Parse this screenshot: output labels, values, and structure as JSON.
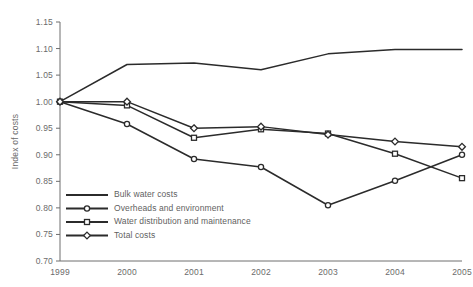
{
  "chart_data": {
    "type": "line",
    "title": "",
    "xlabel": "",
    "ylabel": "Index of costs",
    "categories": [
      "1999",
      "2000",
      "2001",
      "2002",
      "2003",
      "2004",
      "2005"
    ],
    "x": [
      1999,
      2000,
      2001,
      2002,
      2003,
      2004,
      2005
    ],
    "ylim": [
      0.7,
      1.15
    ],
    "yticks": [
      "0.70",
      "0.75",
      "0.80",
      "0.85",
      "0.90",
      "0.95",
      "1.00",
      "1.05",
      "1.10",
      "1.15"
    ],
    "ytick_values": [
      0.7,
      0.75,
      0.8,
      0.85,
      0.9,
      0.95,
      1.0,
      1.05,
      1.1,
      1.15
    ],
    "grid": false,
    "legend_position": "inside-lower-left",
    "series": [
      {
        "name": "Bulk water costs",
        "marker": "none",
        "values": [
          1.0,
          1.07,
          1.073,
          1.06,
          1.09,
          1.098,
          1.098
        ]
      },
      {
        "name": "Overheads and environment",
        "marker": "circle",
        "values": [
          1.0,
          0.958,
          0.892,
          0.877,
          0.805,
          0.851,
          0.9
        ]
      },
      {
        "name": "Water distribution and maintenance",
        "marker": "square",
        "values": [
          1.0,
          0.993,
          0.932,
          0.948,
          0.94,
          0.902,
          0.856
        ]
      },
      {
        "name": "Total costs",
        "marker": "diamond",
        "values": [
          1.0,
          1.0,
          0.95,
          0.953,
          0.938,
          0.925,
          0.915
        ]
      }
    ],
    "colors": {
      "line": "#2b2b2b",
      "marker_fill": "#ffffff",
      "axis": "#6e6e6e",
      "text": "#6b6b6b",
      "background": "#ffffff"
    }
  }
}
